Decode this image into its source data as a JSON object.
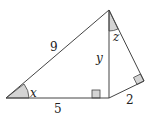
{
  "figure": {
    "labels": {
      "hypotenuse": "9",
      "base": "5",
      "right_leg": "2",
      "altitude": "y",
      "angle_left": "x",
      "angle_top": "z"
    },
    "colors": {
      "stroke": "#444444",
      "angle_fill": "#d4d4d4",
      "right_angle_fill": "#d4d4d4"
    }
  }
}
